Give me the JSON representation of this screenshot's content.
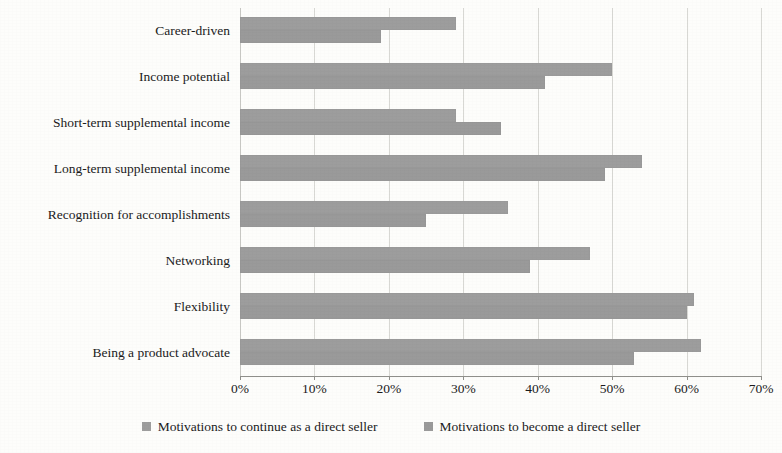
{
  "chart_data": {
    "type": "bar",
    "orientation": "horizontal",
    "title": "",
    "subtitle": "",
    "xlabel": "",
    "ylabel": "",
    "xlim": [
      0,
      70
    ],
    "xtick_step": 10,
    "xtick_labels": [
      "0%",
      "10%",
      "20%",
      "30%",
      "40%",
      "50%",
      "60%",
      "70%"
    ],
    "xtick_values": [
      0,
      10,
      20,
      30,
      40,
      50,
      60,
      70
    ],
    "grid": true,
    "grid_axis": "x",
    "legend_position": "bottom",
    "categories": [
      "Career-driven",
      "Income potential",
      "Short-term supplemental income",
      "Long-term supplemental income",
      "Recognition for accomplishments",
      "Networking",
      "Flexibility",
      "Being a product advocate"
    ],
    "series": [
      {
        "name": "Motivations to continue as a direct seller",
        "color": "#9d9d9d",
        "values": [
          29,
          50,
          29,
          54,
          36,
          47,
          61,
          62
        ]
      },
      {
        "name": "Motivations to become a direct seller",
        "color": "#9a9a9a",
        "values": [
          19,
          41,
          35,
          49,
          25,
          39,
          60,
          53
        ]
      }
    ]
  },
  "legend": {
    "items": [
      {
        "label": "Motivations to continue as a direct seller",
        "color": "#9d9d9d"
      },
      {
        "label": "Motivations to become a direct seller",
        "color": "#9a9a9a"
      }
    ]
  },
  "page": {
    "background_color": "#fdfdfb",
    "text_color": "#1b1b1b",
    "grid_color": "#d8d8d4",
    "axis_color": "#8f8f8b"
  }
}
